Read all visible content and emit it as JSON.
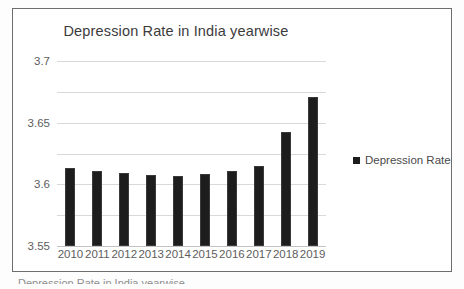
{
  "chart_data": {
    "type": "bar",
    "title": "Depression Rate in India yearwise",
    "xlabel": "",
    "ylabel": "",
    "categories": [
      "2010",
      "2011",
      "2012",
      "2013",
      "2014",
      "2015",
      "2016",
      "2017",
      "2018",
      "2019"
    ],
    "series": [
      {
        "name": "Depression Rate",
        "values": [
          3.527,
          3.522,
          3.518,
          3.515,
          3.513,
          3.516,
          3.521,
          3.53,
          3.585,
          3.641
        ]
      }
    ],
    "ylim": [
      3.4,
      3.7
    ],
    "yticks": [
      "3.4",
      "3.45",
      "3.5",
      "3.55",
      "3.6",
      "3.65",
      "3.7"
    ],
    "ytick_values": [
      3.4,
      3.45,
      3.5,
      3.55,
      3.6,
      3.65,
      3.7
    ],
    "grid": true,
    "legend_position": "right",
    "bar_color": "#1d1d1d",
    "grid_color": "#d9d9d9",
    "text_color": "#5d5d5d",
    "title_color": "#3b3b3b"
  },
  "legend": {
    "entries": [
      {
        "label": "Depression Rate",
        "color": "#1d1d1d",
        "marker": "square-marker"
      }
    ]
  },
  "caption": {
    "ghost_text": "Depression Rate in India yearwise"
  }
}
